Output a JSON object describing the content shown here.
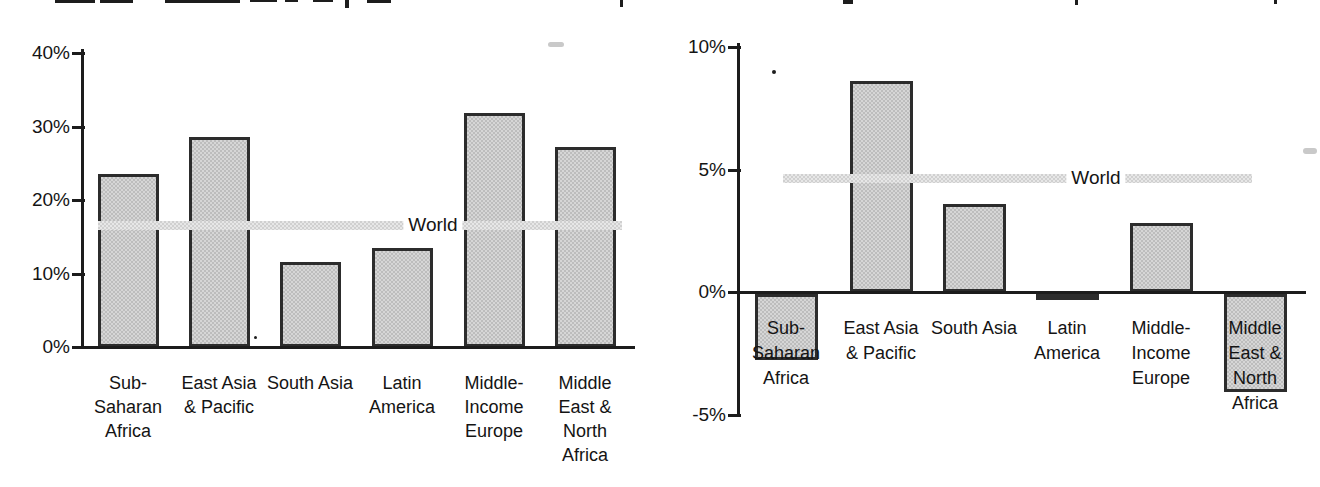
{
  "figure": {
    "note_top_title": "",
    "colors": {
      "background": "#ffffff",
      "bar_fill": "#c9c9c9",
      "bar_border": "#2c2c2c",
      "axis": "#1c1c1c",
      "text": "#141414",
      "world_line": "#d9d9d9"
    }
  },
  "chart_data": [
    {
      "id": "left_chart",
      "type": "bar",
      "title": "",
      "categories": [
        "Sub-Saharan Africa",
        "East Asia & Pacific",
        "South Asia",
        "Latin America",
        "Middle-Income Europe",
        "Middle East & North Africa"
      ],
      "category_label_lines": [
        [
          "Sub-",
          "Saharan",
          "Africa"
        ],
        [
          "East Asia",
          "& Pacific"
        ],
        [
          "South Asia"
        ],
        [
          "Latin",
          "America"
        ],
        [
          "Middle-",
          "Income",
          "Europe"
        ],
        [
          "Middle",
          "East &",
          "North",
          "Africa"
        ]
      ],
      "values": [
        23.5,
        28.6,
        11.6,
        13.5,
        31.8,
        27.2
      ],
      "unit": "%",
      "ylim": [
        0,
        40
      ],
      "yticks": [
        {
          "value": 40,
          "label": "40%"
        },
        {
          "value": 30,
          "label": "30%"
        },
        {
          "value": 20,
          "label": "20%"
        },
        {
          "value": 10,
          "label": "10%"
        },
        {
          "value": 0,
          "label": "0%"
        }
      ],
      "reference_line": {
        "label": "World",
        "value": 16.6
      },
      "grid": false,
      "legend": "none"
    },
    {
      "id": "right_chart",
      "type": "bar",
      "title": "",
      "categories": [
        "Sub-Saharan Africa",
        "East Asia & Pacific",
        "South Asia",
        "Latin America",
        "Middle-Income Europe",
        "Middle East & North Africa"
      ],
      "category_label_lines": [
        [
          "Sub-",
          "Saharan",
          "Africa"
        ],
        [
          "East Asia",
          "& Pacific"
        ],
        [
          "South Asia"
        ],
        [
          "Latin",
          "America"
        ],
        [
          "Middle-",
          "Income",
          "Europe"
        ],
        [
          "Middle",
          "East &",
          "North",
          "Africa"
        ]
      ],
      "values": [
        -2.7,
        8.6,
        3.6,
        -0.25,
        2.8,
        -4.0
      ],
      "unit": "%",
      "ylim": [
        -5,
        10
      ],
      "yticks": [
        {
          "value": 10,
          "label": "10%"
        },
        {
          "value": 5,
          "label": "5%"
        },
        {
          "value": 0,
          "label": "0%"
        },
        {
          "value": -5,
          "label": "-5%"
        }
      ],
      "reference_line": {
        "label": "World",
        "value": 4.65
      },
      "grid": false,
      "legend": "none"
    }
  ]
}
